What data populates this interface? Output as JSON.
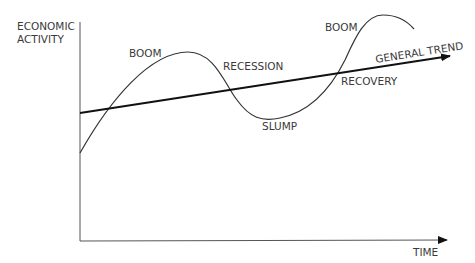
{
  "diagram": {
    "type": "business-cycle",
    "axes": {
      "y_label_line1": "ECONOMIC",
      "y_label_line2": "ACTIVITY",
      "x_label": "TIME"
    },
    "labels": {
      "boom_1": "BOOM",
      "recession": "RECESSION",
      "slump": "SLUMP",
      "recovery": "RECOVERY",
      "boom_2": "BOOM",
      "trend": "GENERAL TREND"
    },
    "colors": {
      "line": "#222222",
      "axis": "#555555",
      "text": "#3a3a3a"
    }
  }
}
